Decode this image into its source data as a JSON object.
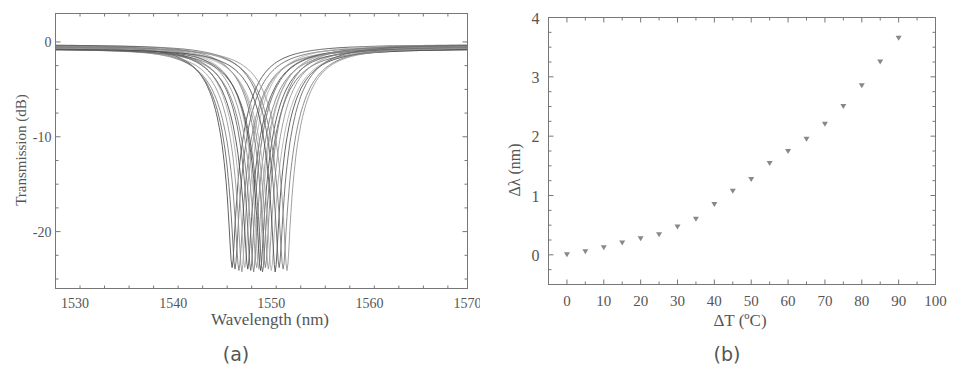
{
  "chart_data": [
    {
      "id": "a",
      "type": "line",
      "caption": "(a)",
      "title": "",
      "xlabel": "Wavelength (nm)",
      "ylabel": "Transmission (dB)",
      "xlim": [
        1528,
        1570
      ],
      "ylim": [
        -26,
        3
      ],
      "xticks": [
        1530,
        1540,
        1550,
        1560,
        1570
      ],
      "xtick_labels": [
        "1530",
        "1540",
        "1550",
        "1560",
        "1570"
      ],
      "yticks": [
        0,
        -10,
        -20
      ],
      "ytick_labels": [
        "0",
        "-10",
        "-20"
      ],
      "grid": false,
      "legend": null,
      "line_color": "#555555",
      "description": "Family of transmission dips (notch spectra), baseline ~0 dB, minimum ~-23.5 dB, dip centers shifting with temperature",
      "series_dip_centers_nm": [
        1546.0,
        1546.3,
        1546.7,
        1547.0,
        1547.3,
        1547.6,
        1547.9,
        1548.2,
        1548.5,
        1548.7,
        1548.9,
        1549.1,
        1549.4,
        1549.7,
        1550.0,
        1550.4,
        1550.8,
        1551.2,
        1551.6
      ],
      "dip_depth_db": -23.5,
      "baseline_db": 0
    },
    {
      "id": "b",
      "type": "scatter",
      "caption": "(b)",
      "title": "",
      "xlabel": "ΔT (ºC)",
      "ylabel": "Δλ (nm)",
      "xlim": [
        -5,
        100
      ],
      "ylim": [
        -0.5,
        4
      ],
      "xticks": [
        0,
        10,
        20,
        30,
        40,
        50,
        60,
        70,
        80,
        90,
        100
      ],
      "xtick_labels": [
        "0",
        "10",
        "20",
        "30",
        "40",
        "50",
        "60",
        "70",
        "80",
        "90",
        "100"
      ],
      "yticks": [
        0,
        1,
        2,
        3,
        4
      ],
      "ytick_labels": [
        "0",
        "1",
        "2",
        "3",
        "4"
      ],
      "grid": false,
      "legend": null,
      "marker": "down-triangle",
      "marker_color": "#888888",
      "x": [
        0,
        5,
        10,
        15,
        20,
        25,
        30,
        35,
        40,
        45,
        50,
        55,
        60,
        65,
        70,
        75,
        80,
        85,
        90
      ],
      "values": [
        0.0,
        0.05,
        0.12,
        0.2,
        0.27,
        0.34,
        0.47,
        0.6,
        0.85,
        1.07,
        1.27,
        1.54,
        1.74,
        1.95,
        2.2,
        2.5,
        2.85,
        3.25,
        3.65
      ]
    }
  ],
  "figure": {
    "panel_a_caption": "(a)",
    "panel_b_caption": "(b)",
    "panel_a_xlabel": "Wavelength (nm)",
    "panel_a_ylabel": "Transmission (dB)",
    "panel_b_xlabel": "ΔT (ºC)",
    "panel_b_ylabel": "Δλ (nm)"
  }
}
